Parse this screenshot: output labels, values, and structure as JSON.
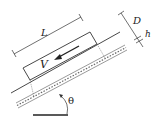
{
  "diagram": {
    "labels": {
      "length": "L",
      "velocity": "V",
      "thickness_block": "D",
      "film_gap": "h",
      "angle": "θ"
    },
    "colors": {
      "stroke": "#333333",
      "background": "#ffffff"
    }
  }
}
